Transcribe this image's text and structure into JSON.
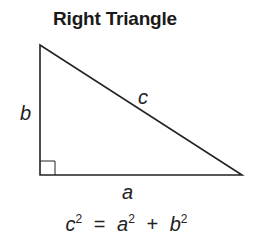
{
  "title": "Right Triangle",
  "labels": {
    "a": "a",
    "b": "b",
    "c": "c"
  },
  "formula": {
    "lhs_var": "c",
    "lhs_exp": "2",
    "eq": "=",
    "t1_var": "a",
    "t1_exp": "2",
    "plus": "+",
    "t2_var": "b",
    "t2_exp": "2"
  },
  "colors": {
    "stroke": "#222222",
    "background": "#ffffff"
  }
}
